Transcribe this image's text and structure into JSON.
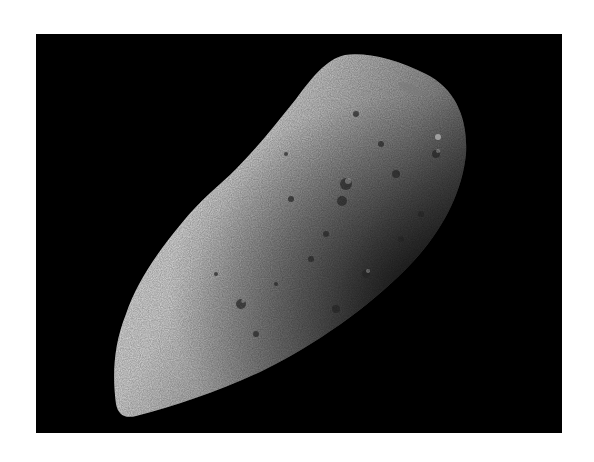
{
  "image": {
    "subject": "Asteroid (irregular cratered rocky body) against black space",
    "alt": "Grayscale photograph of an elongated, heavily cratered asteroid lit from the left, on a black background",
    "colors": {
      "page_background": "#ffffff",
      "space": "#000000",
      "lit_surface": "#e8e8e8",
      "mid_surface": "#9a9a9a",
      "shadow_surface": "#2a2a2a"
    }
  }
}
